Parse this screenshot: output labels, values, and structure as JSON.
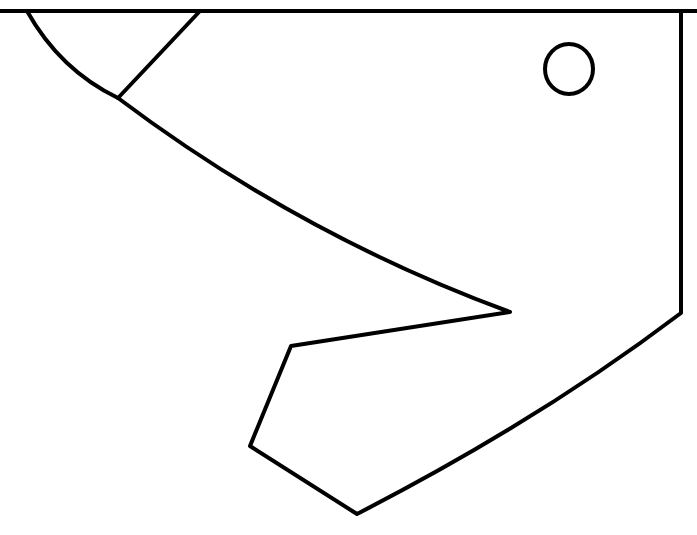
{
  "diagram": {
    "type": "line-drawing",
    "stroke_color": "#000000",
    "background_color": "#ffffff",
    "top_caption": "",
    "top_caption_note": "clipped at top edge, illegible",
    "top_line": {
      "x1": 0,
      "y1": 11,
      "x2": 697,
      "y2": 11
    },
    "outline_path": "M27 11 Q60 70 118 98 Q300 235 510 312 L291 346 L250 446 L357 514 Q540 420 681 313 L681 11",
    "inner_line": {
      "x1": 200,
      "y1": 11,
      "x2": 118,
      "y2": 98
    },
    "eye": {
      "cx": 569,
      "cy": 69,
      "rx": 24,
      "ry": 25
    }
  }
}
